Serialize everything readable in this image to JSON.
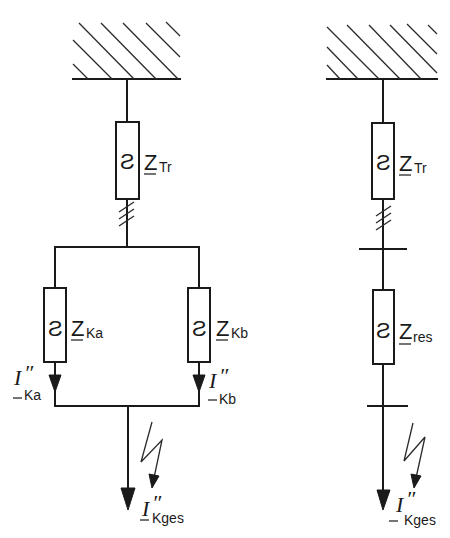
{
  "diagram": {
    "left": {
      "transformer_impedance": {
        "symbol": "Z",
        "subscript": "Tr"
      },
      "branch_a": {
        "impedance": {
          "symbol": "Z",
          "subscript": "Ka"
        },
        "current": {
          "symbol": "I",
          "prime": "″",
          "subscript": "Ka"
        }
      },
      "branch_b": {
        "impedance": {
          "symbol": "Z",
          "subscript": "Kb"
        },
        "current": {
          "symbol": "I",
          "prime": "″",
          "subscript": "Kb"
        }
      },
      "total_current": {
        "symbol": "I",
        "prime": "″",
        "subscript": "Kges"
      }
    },
    "right": {
      "transformer_impedance": {
        "symbol": "Z",
        "subscript": "Tr"
      },
      "resulting_impedance": {
        "symbol": "Z",
        "subscript": "res"
      },
      "total_current": {
        "symbol": "I",
        "prime": "″",
        "subscript": "Kges"
      }
    },
    "impedance_glyph": "~",
    "colors": {
      "line": "#1a1a1a",
      "background": "#ffffff"
    }
  }
}
